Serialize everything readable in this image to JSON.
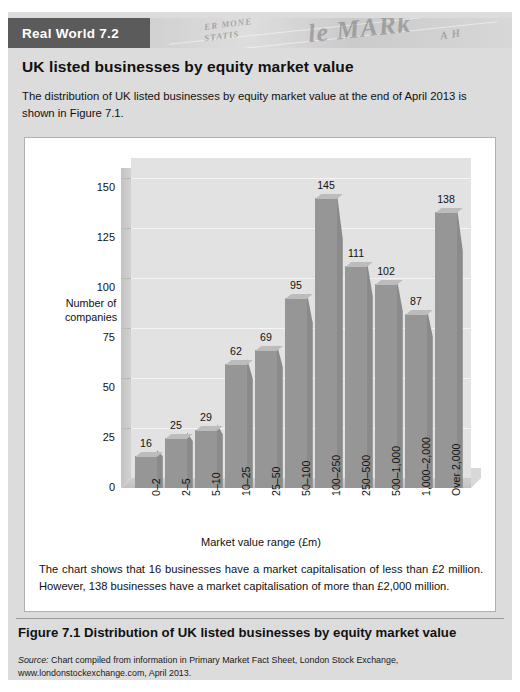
{
  "banner": {
    "tag": "Real World 7.2",
    "newspaper_fragments": [
      "ER MONE",
      "STATIS",
      "le MARk",
      "A H"
    ]
  },
  "heading": "UK listed businesses by equity market value",
  "intro": "The distribution of UK listed businesses by equity market value at the end of April 2013 is shown in Figure 7.1.",
  "panel_note_line1": "The chart shows that 16 businesses have a market capitalisation of less than £2 million.",
  "panel_note_line2": "However, 138 businesses have a market capitalisation of more than £2,000 million.",
  "caption": "Figure 7.1  Distribution of UK listed businesses by equity market value",
  "source_prefix": "Source:",
  "source_text": " Chart compiled from information in Primary Market Fact Sheet, London Stock Exchange, www.londonstockexchange.com, April 2013.",
  "colors": {
    "banner_tag_bg": "#5b5b5b",
    "box_bg": "#dcdcdc",
    "panel_bg": "#ffffff",
    "bar_front": "#969696",
    "bar_top": "#bcbcbc",
    "bar_side": "#8a8a8a",
    "plot_bg": "#e2e2e2"
  },
  "chart_data": {
    "type": "bar",
    "title": "",
    "xlabel": "Market value range (£m)",
    "ylabel": "Number of companies",
    "categories": [
      "0–2",
      "2–5",
      "5–10",
      "10–25",
      "25–50",
      "50–100",
      "100–250",
      "250–500",
      "500–1,000",
      "1,000–2,000",
      "Over 2,000"
    ],
    "values": [
      16,
      25,
      29,
      62,
      69,
      95,
      145,
      111,
      102,
      87,
      138
    ],
    "ylim": [
      0,
      160
    ],
    "yticks": [
      0,
      25,
      50,
      75,
      100,
      125,
      150
    ],
    "ytick_labels": [
      "0",
      "25",
      "50",
      "75",
      "100",
      "125",
      "150"
    ],
    "grid": true,
    "legend": "none",
    "data_labels": true,
    "style": "3d-column"
  }
}
